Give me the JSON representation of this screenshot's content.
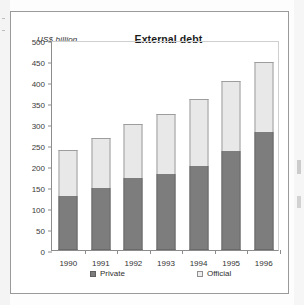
{
  "figure": {
    "axis_unit_label": "US$ billion",
    "title": "External debt"
  },
  "legend": {
    "private_label": "Private",
    "official_label": "Official"
  },
  "chart_data": {
    "type": "bar",
    "subtype": "stacked-vertical",
    "title": "External debt",
    "xlabel": "",
    "ylabel": "US$ billion",
    "ylim": [
      0,
      500
    ],
    "yticks": [
      0,
      50,
      100,
      150,
      200,
      250,
      300,
      350,
      400,
      450,
      500
    ],
    "grid": false,
    "legend_position": "bottom",
    "categories": [
      "1990",
      "1991",
      "1992",
      "1993",
      "1994",
      "1995",
      "1996"
    ],
    "series": [
      {
        "name": "Private",
        "color": "#7d7d7d",
        "values": [
          128,
          148,
          171,
          181,
          200,
          236,
          282
        ]
      },
      {
        "name": "Official",
        "color": "#e8e8e8",
        "values": [
          110,
          119,
          128,
          143,
          159,
          167,
          166
        ]
      }
    ],
    "totals": [
      238,
      267,
      299,
      324,
      359,
      403,
      448
    ]
  }
}
